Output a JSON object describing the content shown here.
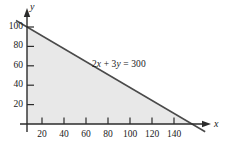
{
  "figure": {
    "background_color": "#ffffff",
    "axis_color": "#2b2b2b",
    "line_color": "#4a4a4a",
    "shade_color": "#e8e8e8",
    "text_color": "#1a1a1a",
    "x_axis_name": "x",
    "y_axis_name": "y",
    "equation_label": "2x + 3y = 300",
    "equation_parts": {
      "coef_x": "2",
      "var_x": "x",
      "plus": " + ",
      "coef_y": "3",
      "var_y": "y",
      "equals": " = ",
      "constant": "300"
    }
  },
  "chart_data": {
    "type": "line",
    "title": "",
    "subtitle": "",
    "xlabel": "x",
    "ylabel": "y",
    "xlim": [
      0,
      170
    ],
    "ylim": [
      0,
      110
    ],
    "xticks": [
      20,
      40,
      60,
      80,
      100,
      120,
      140
    ],
    "yticks": [
      20,
      40,
      60,
      80,
      100
    ],
    "xtick_labels": [
      "20",
      "40",
      "60",
      "80",
      "100",
      "120",
      "140"
    ],
    "ytick_labels": [
      "20",
      "40",
      "60",
      "80",
      "100"
    ],
    "grid": false,
    "legend": false,
    "legend_position": "none",
    "annotations": [
      {
        "text": "2x + 3y = 300",
        "x": 75,
        "y": 65,
        "type": "equation-label"
      }
    ],
    "series": [
      {
        "name": "2x + 3y = 300",
        "type": "line",
        "equation": "2x + 3y = 300",
        "slope": -0.6666666667,
        "intercept": 100,
        "x_intercept": 150,
        "y_intercept": 100,
        "points": [
          [
            0,
            100
          ],
          [
            150,
            0
          ]
        ],
        "drawn_extent": [
          [
            -10,
            106.7
          ],
          [
            162,
            -8
          ]
        ],
        "color": "#4a4a4a"
      }
    ],
    "shaded_regions": [
      {
        "name": "feasible-region",
        "description": "region bounded by x >= 0, y >= 0, 2x + 3y <= 300",
        "vertices": [
          [
            0,
            0
          ],
          [
            150,
            0
          ],
          [
            0,
            100
          ]
        ],
        "color": "#e8e8e8"
      }
    ]
  }
}
